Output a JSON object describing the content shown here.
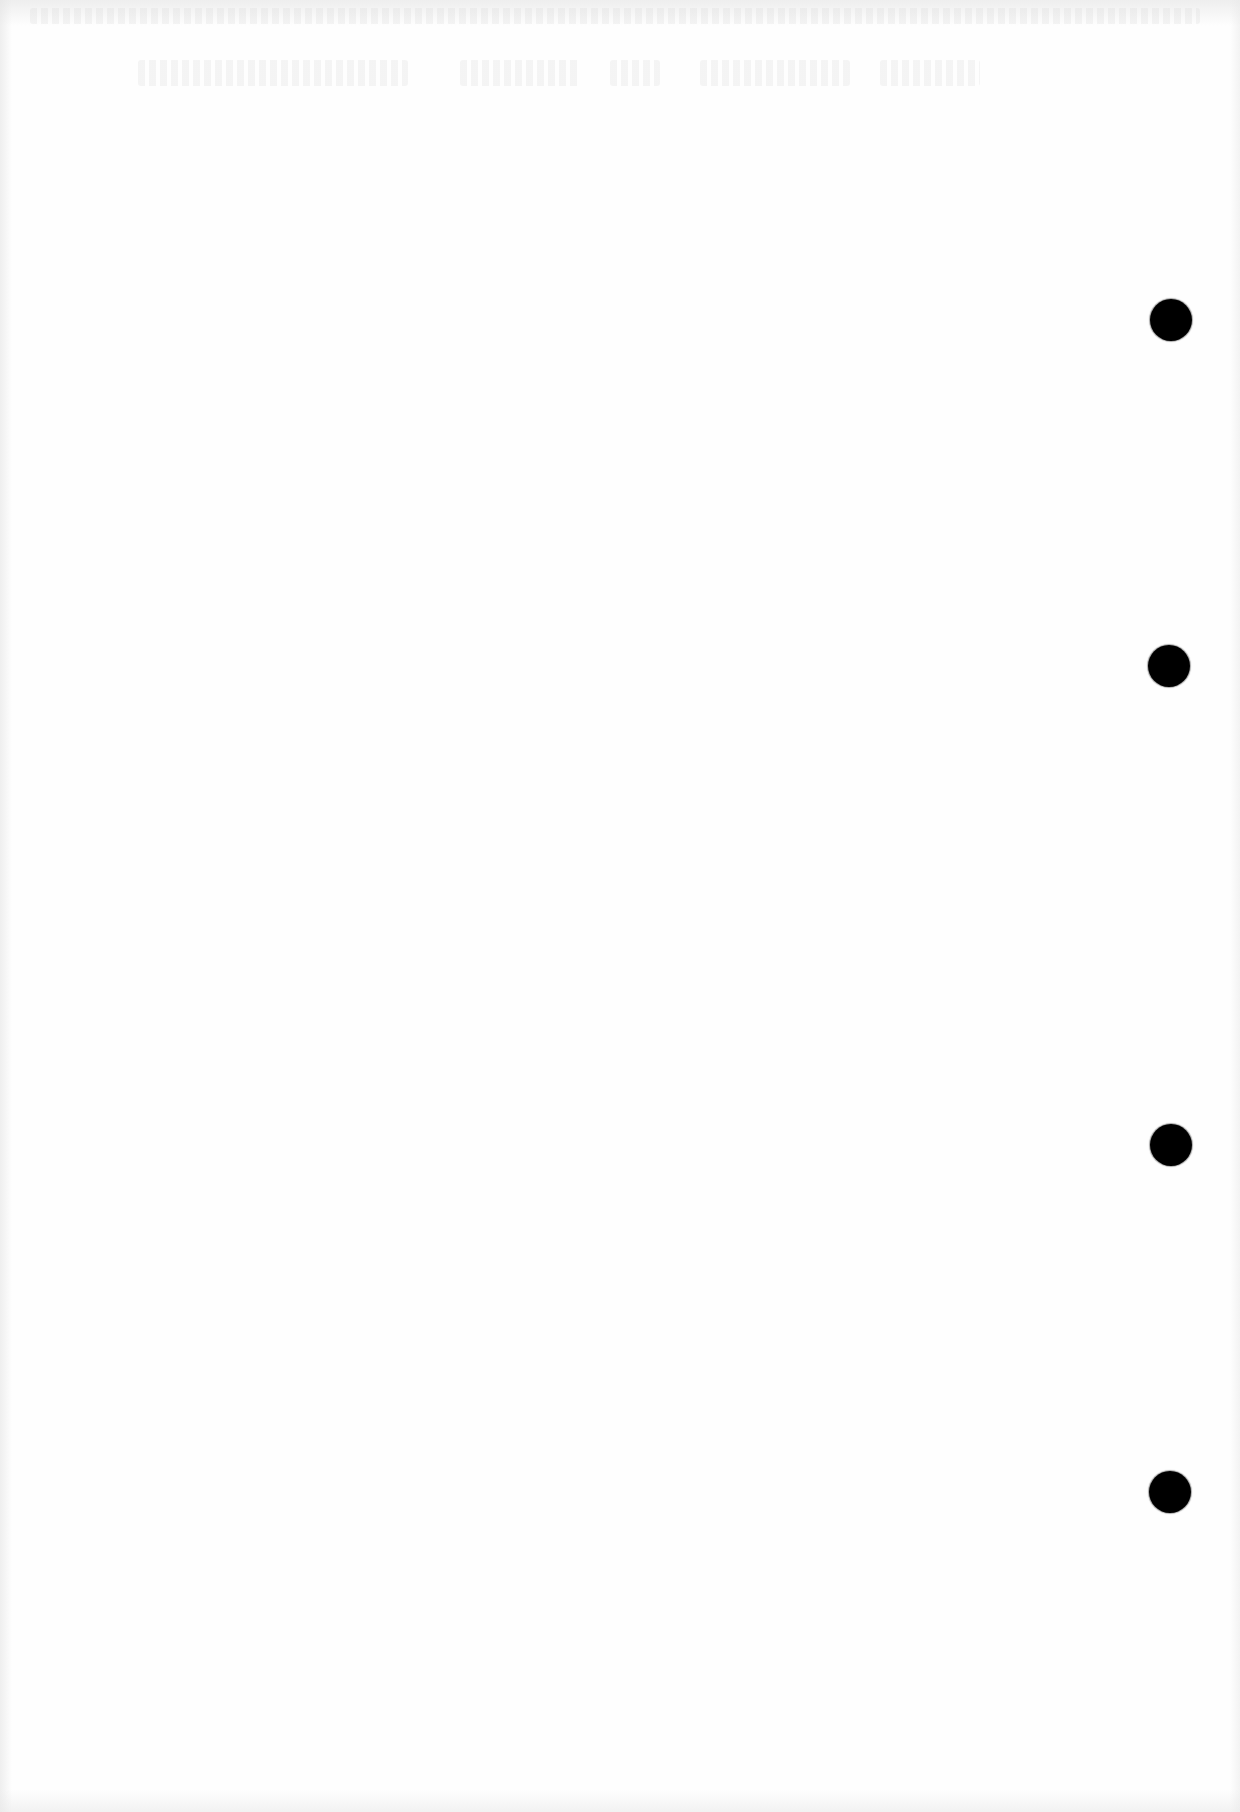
{
  "document": {
    "type": "scanned-blank-page",
    "page_color": "#fefefe",
    "text_content": [],
    "show_through_text_legible": false
  },
  "punch_holes": [
    {
      "cx": 1171,
      "cy": 320,
      "r": 21,
      "color": "#000000"
    },
    {
      "cx": 1169,
      "cy": 666,
      "r": 21,
      "color": "#000000"
    },
    {
      "cx": 1171,
      "cy": 1145,
      "r": 21,
      "color": "#000000"
    },
    {
      "cx": 1170,
      "cy": 1492,
      "r": 21,
      "color": "#000000"
    }
  ]
}
